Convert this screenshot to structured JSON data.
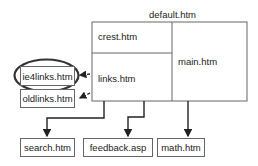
{
  "diagram": {
    "frameset": {
      "title": "default.htm",
      "frames": {
        "top_left": "crest.htm",
        "bottom_left": "links.htm",
        "right": "main.htm"
      }
    },
    "alternates": {
      "highlighted": "ie4links.htm",
      "fallback": "oldlinks.htm"
    },
    "targets": [
      "search.htm",
      "feedback.asp",
      "math.htm"
    ],
    "colors": {
      "line": "#666666",
      "arrow": "#222222",
      "highlight_ellipse": "#333333"
    }
  }
}
